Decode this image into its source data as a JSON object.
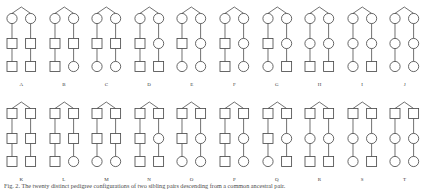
{
  "figure": {
    "caption_label": "Fig. 2.",
    "caption_text": "Fig. 2.  The twenty distinct pedigree configurations of two sibling pairs descending from a common ancestral pair.",
    "width": 446,
    "height": 196,
    "stroke_color": "#4d4d4d",
    "background_color": "#ffffff"
  },
  "legend": {
    "square_meaning": "male",
    "circle_meaning": "female",
    "triangle_meaning": "ancestral mating"
  },
  "rows": [
    {
      "row_name": "top-row",
      "generation1_shape": "circle",
      "cells": [
        {
          "label": "A",
          "generation1": [
            "circle",
            "circle"
          ],
          "generation2": [
            "square",
            "square"
          ],
          "generation3": [
            "square",
            "square"
          ]
        },
        {
          "label": "B",
          "generation1": [
            "circle",
            "circle"
          ],
          "generation2": [
            "square",
            "square"
          ],
          "generation3": [
            "square",
            "circle"
          ]
        },
        {
          "label": "C",
          "generation1": [
            "circle",
            "circle"
          ],
          "generation2": [
            "square",
            "square"
          ],
          "generation3": [
            "circle",
            "circle"
          ]
        },
        {
          "label": "D",
          "generation1": [
            "circle",
            "circle"
          ],
          "generation2": [
            "square",
            "circle"
          ],
          "generation3": [
            "square",
            "square"
          ]
        },
        {
          "label": "E",
          "generation1": [
            "circle",
            "circle"
          ],
          "generation2": [
            "square",
            "circle"
          ],
          "generation3": [
            "circle",
            "circle"
          ]
        },
        {
          "label": "F",
          "generation1": [
            "circle",
            "circle"
          ],
          "generation2": [
            "square",
            "circle"
          ],
          "generation3": [
            "square",
            "circle"
          ]
        },
        {
          "label": "G",
          "generation1": [
            "circle",
            "circle"
          ],
          "generation2": [
            "square",
            "circle"
          ],
          "generation3": [
            "circle",
            "square"
          ]
        },
        {
          "label": "H",
          "generation1": [
            "circle",
            "circle"
          ],
          "generation2": [
            "circle",
            "circle"
          ],
          "generation3": [
            "square",
            "square"
          ]
        },
        {
          "label": "I",
          "generation1": [
            "circle",
            "circle"
          ],
          "generation2": [
            "circle",
            "circle"
          ],
          "generation3": [
            "circle",
            "square"
          ]
        },
        {
          "label": "J",
          "generation1": [
            "circle",
            "circle"
          ],
          "generation2": [
            "circle",
            "circle"
          ],
          "generation3": [
            "circle",
            "circle"
          ]
        }
      ]
    },
    {
      "row_name": "bottom-row",
      "generation1_shape": "square",
      "cells": [
        {
          "label": "K",
          "generation1": [
            "square",
            "square"
          ],
          "generation2": [
            "square",
            "square"
          ],
          "generation3": [
            "square",
            "square"
          ]
        },
        {
          "label": "L",
          "generation1": [
            "square",
            "square"
          ],
          "generation2": [
            "square",
            "square"
          ],
          "generation3": [
            "square",
            "circle"
          ]
        },
        {
          "label": "M",
          "generation1": [
            "square",
            "square"
          ],
          "generation2": [
            "square",
            "square"
          ],
          "generation3": [
            "circle",
            "circle"
          ]
        },
        {
          "label": "N",
          "generation1": [
            "square",
            "square"
          ],
          "generation2": [
            "square",
            "circle"
          ],
          "generation3": [
            "square",
            "square"
          ]
        },
        {
          "label": "O",
          "generation1": [
            "square",
            "square"
          ],
          "generation2": [
            "square",
            "circle"
          ],
          "generation3": [
            "circle",
            "circle"
          ]
        },
        {
          "label": "P",
          "generation1": [
            "square",
            "square"
          ],
          "generation2": [
            "square",
            "circle"
          ],
          "generation3": [
            "square",
            "circle"
          ]
        },
        {
          "label": "Q",
          "generation1": [
            "square",
            "square"
          ],
          "generation2": [
            "square",
            "circle"
          ],
          "generation3": [
            "circle",
            "square"
          ]
        },
        {
          "label": "R",
          "generation1": [
            "square",
            "square"
          ],
          "generation2": [
            "circle",
            "circle"
          ],
          "generation3": [
            "square",
            "square"
          ]
        },
        {
          "label": "S",
          "generation1": [
            "square",
            "square"
          ],
          "generation2": [
            "circle",
            "circle"
          ],
          "generation3": [
            "circle",
            "square"
          ]
        },
        {
          "label": "T",
          "generation1": [
            "square",
            "square"
          ],
          "generation2": [
            "circle",
            "circle"
          ],
          "generation3": [
            "circle",
            "circle"
          ]
        }
      ]
    }
  ]
}
